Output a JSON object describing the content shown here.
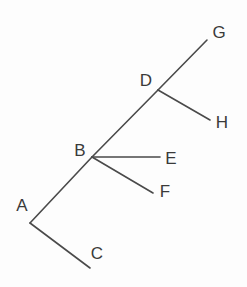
{
  "diagram": {
    "type": "tree",
    "line_color": "#4a4a4a",
    "label_color": "#3a3a3a",
    "nodes": [
      {
        "id": "A",
        "label": "A",
        "x": 30,
        "y": 223,
        "label_x": 22,
        "label_y": 205
      },
      {
        "id": "B",
        "label": "B",
        "x": 92,
        "y": 157,
        "label_x": 80,
        "label_y": 150
      },
      {
        "id": "C",
        "label": "C",
        "x": 90,
        "y": 268,
        "label_x": 97,
        "label_y": 253
      },
      {
        "id": "D",
        "label": "D",
        "x": 158,
        "y": 90,
        "label_x": 146,
        "label_y": 80
      },
      {
        "id": "E",
        "label": "E",
        "x": 160,
        "y": 157,
        "label_x": 171,
        "label_y": 158
      },
      {
        "id": "F",
        "label": "F",
        "x": 153,
        "y": 193,
        "label_x": 165,
        "label_y": 191
      },
      {
        "id": "G",
        "label": "G",
        "x": 207,
        "y": 40,
        "label_x": 219,
        "label_y": 32
      },
      {
        "id": "H",
        "label": "H",
        "x": 210,
        "y": 120,
        "label_x": 222,
        "label_y": 122
      }
    ],
    "edges": [
      {
        "from": "A",
        "to": "B"
      },
      {
        "from": "B",
        "to": "D"
      },
      {
        "from": "D",
        "to": "G"
      },
      {
        "from": "D",
        "to": "H"
      },
      {
        "from": "B",
        "to": "E"
      },
      {
        "from": "B",
        "to": "F"
      },
      {
        "from": "A",
        "to": "C"
      }
    ]
  }
}
